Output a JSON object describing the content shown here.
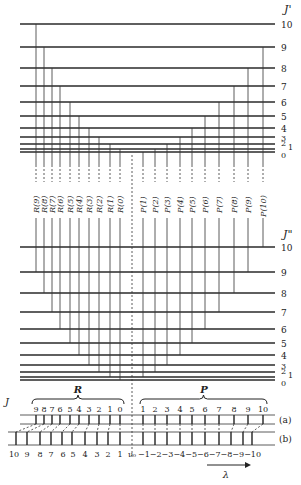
{
  "upper_state": {
    "label": "J'",
    "levels": [
      {
        "J": "0",
        "y": 152
      },
      {
        "J": "1",
        "y": 149
      },
      {
        "J": "2",
        "y": 144
      },
      {
        "J": "3",
        "y": 137
      },
      {
        "J": "4",
        "y": 128
      },
      {
        "J": "5",
        "y": 116
      },
      {
        "J": "6",
        "y": 102
      },
      {
        "J": "7",
        "y": 86
      },
      {
        "J": "8",
        "y": 68
      },
      {
        "J": "9",
        "y": 47
      },
      {
        "J": "10",
        "y": 24
      }
    ]
  },
  "lower_state": {
    "label": "J\"",
    "levels": [
      {
        "J": "0",
        "y": 380
      },
      {
        "J": "1",
        "y": 377
      },
      {
        "J": "2",
        "y": 372
      },
      {
        "J": "3",
        "y": 365
      },
      {
        "J": "4",
        "y": 355
      },
      {
        "J": "5",
        "y": 343
      },
      {
        "J": "6",
        "y": 329
      },
      {
        "J": "7",
        "y": 312
      },
      {
        "J": "8",
        "y": 293
      },
      {
        "J": "9",
        "y": 272
      },
      {
        "J": "10",
        "y": 247
      }
    ]
  },
  "transitions": {
    "R": [
      {
        "label": "R(9)",
        "x": 36,
        "up": 10,
        "low": 9
      },
      {
        "label": "R(8)",
        "x": 44,
        "up": 9,
        "low": 8
      },
      {
        "label": "R(7)",
        "x": 52,
        "up": 8,
        "low": 7
      },
      {
        "label": "R(6)",
        "x": 60,
        "up": 7,
        "low": 6
      },
      {
        "label": "R(5)",
        "x": 70,
        "up": 6,
        "low": 5
      },
      {
        "label": "R(4)",
        "x": 79,
        "up": 5,
        "low": 4
      },
      {
        "label": "R(3)",
        "x": 89,
        "up": 4,
        "low": 3
      },
      {
        "label": "R(2)",
        "x": 99,
        "up": 3,
        "low": 2
      },
      {
        "label": "R(1)",
        "x": 110,
        "up": 2,
        "low": 1
      },
      {
        "label": "R(0)",
        "x": 120,
        "up": 1,
        "low": 0
      }
    ],
    "P": [
      {
        "label": "P(1)",
        "x": 143,
        "up": 0,
        "low": 1
      },
      {
        "label": "P(2)",
        "x": 155,
        "up": 1,
        "low": 2
      },
      {
        "label": "P(3)",
        "x": 167,
        "up": 2,
        "low": 3
      },
      {
        "label": "P(4)",
        "x": 180,
        "up": 3,
        "low": 4
      },
      {
        "label": "P(5)",
        "x": 192,
        "up": 4,
        "low": 5
      },
      {
        "label": "P(6)",
        "x": 205,
        "up": 5,
        "low": 6
      },
      {
        "label": "P(7)",
        "x": 219,
        "up": 6,
        "low": 7
      },
      {
        "label": "P(8)",
        "x": 234,
        "up": 7,
        "low": 8
      },
      {
        "label": "P(9)",
        "x": 248,
        "up": 8,
        "low": 9
      },
      {
        "label": "P(10)",
        "x": 263,
        "up": 9,
        "low": 10
      }
    ],
    "center_x": 132
  },
  "spectrum": {
    "J_label": "J",
    "R_branch_label": "R",
    "P_branch_label": "P",
    "a_label": "(a)",
    "b_label": "(b)",
    "a_numbers": [
      "9",
      "8",
      "7",
      "6",
      "5",
      "4",
      "3",
      "2",
      "1",
      "0",
      "1",
      "2",
      "3",
      "4",
      "5",
      "6",
      "7",
      "8",
      "9",
      "10"
    ],
    "a_x": [
      36,
      44,
      52,
      60,
      70,
      79,
      89,
      99,
      110,
      120,
      143,
      155,
      167,
      180,
      192,
      205,
      219,
      234,
      248,
      263
    ],
    "b_x": [
      16,
      27,
      40,
      51,
      62,
      72,
      85,
      97,
      108,
      120,
      143,
      155,
      167,
      180,
      192,
      205,
      219,
      231,
      243,
      252
    ],
    "b_numbers": [
      "10",
      "9",
      "8",
      "7",
      "6",
      "5",
      "4",
      "3",
      "2",
      "1"
    ],
    "b_num_x": [
      14,
      27,
      40,
      51,
      63,
      73,
      85,
      97,
      108,
      120
    ],
    "nu0_label": "ν₀",
    "p_axis_text": "−1−2−3−4−5−6−7−8−9−10",
    "lambda_label": "λ"
  }
}
